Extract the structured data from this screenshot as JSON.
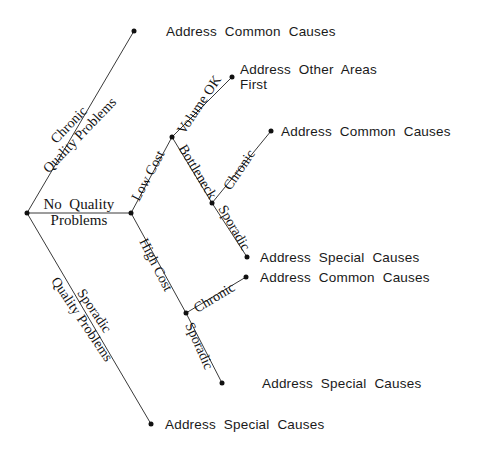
{
  "diagram": {
    "type": "decision-tree",
    "stroke_color": "#3a3a3a",
    "node_color": "#111111",
    "background": "#ffffff"
  },
  "root": {
    "label": "No  Quality\nProblems",
    "x": 27,
    "y": 213
  },
  "nodes": [
    {
      "id": "root",
      "x": 27,
      "y": 213
    },
    {
      "id": "cost-split",
      "x": 131,
      "y": 213
    },
    {
      "id": "low-cost-split",
      "x": 172,
      "y": 137
    },
    {
      "id": "bottleneck-split",
      "x": 212,
      "y": 203
    },
    {
      "id": "high-cost-split",
      "x": 186,
      "y": 313
    },
    {
      "id": "leaf-chronic-top",
      "x": 134,
      "y": 31
    },
    {
      "id": "leaf-volume-ok",
      "x": 232,
      "y": 77
    },
    {
      "id": "leaf-btl-chronic",
      "x": 271,
      "y": 131
    },
    {
      "id": "leaf-btl-sporadic",
      "x": 247,
      "y": 257
    },
    {
      "id": "leaf-hc-chronic",
      "x": 246,
      "y": 277
    },
    {
      "id": "leaf-hc-sporadic",
      "x": 222,
      "y": 383
    },
    {
      "id": "leaf-sporadic-bot",
      "x": 151,
      "y": 424
    }
  ],
  "edges": [
    {
      "id": "edge-chronic-quality",
      "from": "root",
      "to": "leaf-chronic-top",
      "label": "Chronic\nQuality Problems",
      "label_x": 74,
      "label_y": 130,
      "rotate": -46
    },
    {
      "id": "edge-no-quality",
      "from": "root",
      "to": "cost-split",
      "label": "",
      "label_x": 0,
      "label_y": 0,
      "rotate": 0
    },
    {
      "id": "edge-sporadic-quality",
      "from": "root",
      "to": "leaf-sporadic-bot",
      "label": "Sporadic\nQuality Problems",
      "label_x": 88,
      "label_y": 315,
      "rotate": 56
    },
    {
      "id": "edge-low-cost",
      "from": "cost-split",
      "to": "low-cost-split",
      "label": "Low Cost",
      "label_x": 148,
      "label_y": 176,
      "rotate": -62
    },
    {
      "id": "edge-high-cost",
      "from": "cost-split",
      "to": "high-cost-split",
      "label": "High Cost",
      "label_x": 155,
      "label_y": 265,
      "rotate": 63
    },
    {
      "id": "edge-volume-ok",
      "from": "low-cost-split",
      "to": "leaf-volume-ok",
      "label": "Volume OK",
      "label_x": 199,
      "label_y": 105,
      "rotate": -56
    },
    {
      "id": "edge-bottleneck",
      "from": "low-cost-split",
      "to": "bottleneck-split",
      "label": "Bottleneck",
      "label_x": 197,
      "label_y": 172,
      "rotate": 59
    },
    {
      "id": "edge-btl-chronic",
      "from": "bottleneck-split",
      "to": "leaf-btl-chronic",
      "label": "Chronic",
      "label_x": 239,
      "label_y": 170,
      "rotate": -56
    },
    {
      "id": "edge-btl-sporadic",
      "from": "bottleneck-split",
      "to": "leaf-btl-sporadic",
      "label": "Sporadic",
      "label_x": 234,
      "label_y": 228,
      "rotate": 60
    },
    {
      "id": "edge-hc-chronic",
      "from": "high-cost-split",
      "to": "leaf-hc-chronic",
      "label": "Chronic",
      "label_x": 214,
      "label_y": 298,
      "rotate": -31
    },
    {
      "id": "edge-hc-sporadic",
      "from": "high-cost-split",
      "to": "leaf-hc-sporadic",
      "label": "Sporadic",
      "label_x": 199,
      "label_y": 346,
      "rotate": 66
    }
  ],
  "leaf_labels": [
    {
      "id": "leaf-label-chronic-top",
      "text": "Address  Common  Causes",
      "x": 166,
      "y": 31,
      "lines": 1
    },
    {
      "id": "leaf-label-volume-ok",
      "text": "Address  Other  Areas\nFirst",
      "x": 240,
      "y": 77,
      "lines": 2
    },
    {
      "id": "leaf-label-btl-chronic",
      "text": "Address  Common  Causes",
      "x": 281,
      "y": 131,
      "lines": 1
    },
    {
      "id": "leaf-label-btl-sporadic",
      "text": "Address  Special  Causes",
      "x": 260,
      "y": 257,
      "lines": 1
    },
    {
      "id": "leaf-label-hc-chronic",
      "text": "Address  Common  Causes",
      "x": 260,
      "y": 277,
      "lines": 1
    },
    {
      "id": "leaf-label-hc-sporadic",
      "text": "Address  Special  Causes",
      "x": 262,
      "y": 383,
      "lines": 1
    },
    {
      "id": "leaf-label-sporadic-bot",
      "text": "Address  Special  Causes",
      "x": 165,
      "y": 424,
      "lines": 1
    }
  ]
}
